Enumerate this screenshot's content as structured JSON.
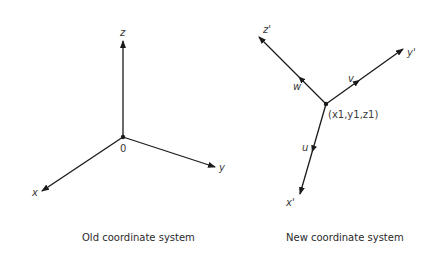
{
  "old_system": {
    "caption": "Old coordinate system",
    "origin_label": "0",
    "axes": {
      "x": "x",
      "y": "y",
      "z": "z"
    }
  },
  "new_system": {
    "caption": "New coordinate system",
    "origin_label": "(x1,y1,z1)",
    "axes": {
      "x": "x'",
      "y": "y'",
      "z": "z'"
    },
    "direction_labels": {
      "u": "u",
      "v": "v",
      "w": "w"
    }
  },
  "colors": {
    "line": "#1a1a1a",
    "text": "#3a3a3a"
  }
}
